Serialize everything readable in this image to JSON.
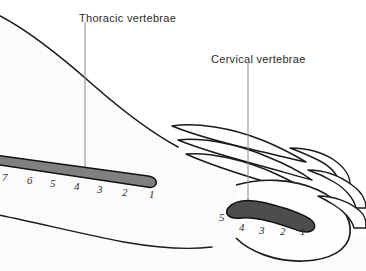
{
  "figure": {
    "type": "anatomical-line-diagram",
    "background_color": "#ffffff",
    "outline_color": "#1a1a1a",
    "body_fill_color": "#fbfbfb"
  },
  "annotations": [
    {
      "id": "thoracic",
      "label": "Thoracic vertebrae",
      "label_x": 79,
      "label_y": 13,
      "leader_x": 85,
      "leader_y_top": 22,
      "leader_y_bottom": 170,
      "leader_color": "#8c8c8c"
    },
    {
      "id": "cervical",
      "label": "Cervical vertebrae",
      "label_x": 211,
      "label_y": 54,
      "leader_x": 248,
      "leader_y_top": 63,
      "leader_y_bottom": 212,
      "leader_color": "#8c8c8c"
    }
  ],
  "vertebral_segments": [
    {
      "id": "thoracic-bar",
      "name": "Thoracic vertebrae",
      "fill_color": "#808080",
      "stroke_color": "#111111",
      "count": 7,
      "numbers": [
        "7",
        "6",
        "5",
        "4",
        "3",
        "2",
        "1"
      ],
      "number_positions": [
        {
          "n": "7",
          "x": 2,
          "y": 172
        },
        {
          "n": "6",
          "x": 27,
          "y": 175
        },
        {
          "n": "5",
          "x": 50,
          "y": 178
        },
        {
          "n": "4",
          "x": 74,
          "y": 181
        },
        {
          "n": "3",
          "x": 97,
          "y": 184
        },
        {
          "n": "2",
          "x": 122,
          "y": 187
        },
        {
          "n": "1",
          "x": 149,
          "y": 189
        }
      ]
    },
    {
      "id": "cervical-bar",
      "name": "Cervical vertebrae",
      "fill_color": "#4d4d4d",
      "stroke_color": "#111111",
      "count": 5,
      "numbers": [
        "5",
        "4",
        "3",
        "2",
        "1"
      ],
      "number_positions": [
        {
          "n": "5",
          "x": 219,
          "y": 212
        },
        {
          "n": "4",
          "x": 239,
          "y": 222
        },
        {
          "n": "3",
          "x": 259,
          "y": 225
        },
        {
          "n": "2",
          "x": 280,
          "y": 226
        },
        {
          "n": "1",
          "x": 300,
          "y": 226
        }
      ]
    }
  ]
}
